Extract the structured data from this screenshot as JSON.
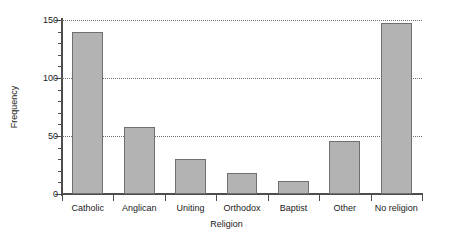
{
  "chart_data": {
    "type": "bar",
    "title": "",
    "xlabel": "Religion",
    "ylabel": "Frequency",
    "categories": [
      "Catholic",
      "Anglican",
      "Uniting",
      "Orthodox",
      "Baptist",
      "Other",
      "No religion"
    ],
    "values": [
      140,
      58,
      30,
      18,
      11,
      46,
      147
    ],
    "ylim": [
      0,
      150
    ],
    "ytick_labels": [
      "0",
      "50",
      "100",
      "150"
    ],
    "ytick_values": [
      0,
      50,
      100,
      150
    ],
    "yminor_step": 10,
    "grid": "horizontal-dotted",
    "legend": "none",
    "bar_fill": "#b3b3b3",
    "bar_edge": "#707070",
    "axis_color": "#4d4d4d",
    "grid_color": "#6e6e6e"
  }
}
